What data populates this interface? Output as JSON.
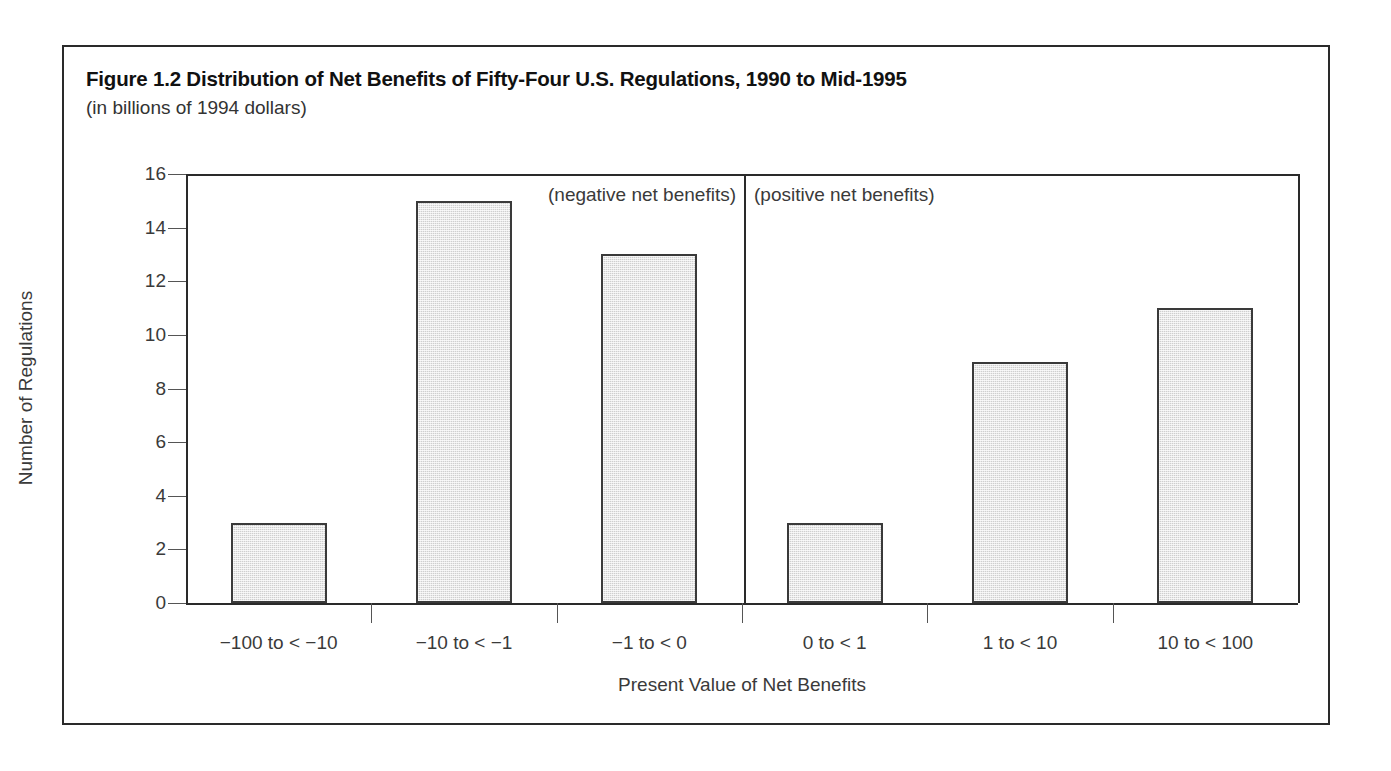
{
  "figure": {
    "title": "Figure 1.2 Distribution of Net Benefits of Fifty-Four U.S. Regulations, 1990 to Mid-1995",
    "subtitle": "(in billions of 1994 dollars)",
    "border_color": "#2a2a2a"
  },
  "annotations": {
    "negative": "(negative net benefits)",
    "positive": "(positive net benefits)"
  },
  "axes": {
    "y_title": "Number of Regulations",
    "x_title": "Present Value of Net Benefits",
    "y_ticks": [
      "0",
      "2",
      "4",
      "6",
      "8",
      "10",
      "12",
      "14",
      "16"
    ]
  },
  "chart_data": {
    "type": "bar",
    "title": "Figure 1.2 Distribution of Net Benefits of Fifty-Four U.S. Regulations, 1990 to Mid-1995",
    "subtitle": "(in billions of 1994 dollars)",
    "xlabel": "Present Value of Net Benefits",
    "ylabel": "Number of Regulations",
    "categories": [
      "−100 to < −10",
      "−10 to < −1",
      "−1 to < 0",
      "0 to < 1",
      "1 to < 10",
      "10 to < 100"
    ],
    "values": [
      3,
      15,
      13,
      3,
      9,
      11
    ],
    "ylim": [
      0,
      16
    ],
    "ytick_step": 2,
    "grid": false,
    "legend": null,
    "bar_fill": "#cfcfcf",
    "bar_edge": "#3a3a3a",
    "annotations": [
      {
        "text": "(negative net benefits)",
        "side": "left-of-divider"
      },
      {
        "text": "(positive net benefits)",
        "side": "right-of-divider"
      }
    ],
    "divider_after_category_index": 2
  }
}
